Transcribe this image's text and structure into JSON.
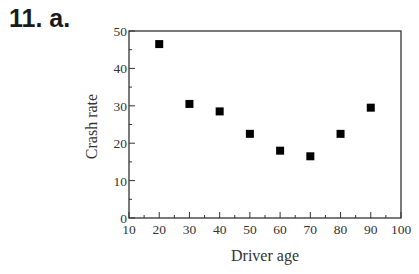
{
  "problem_label": "11.  a.",
  "chart_data": {
    "type": "scatter",
    "title": "",
    "xlabel": "Driver age",
    "ylabel": "Crash rate",
    "xlim": [
      10,
      100
    ],
    "ylim": [
      0,
      50
    ],
    "x_ticks": [
      10,
      20,
      30,
      40,
      50,
      60,
      70,
      80,
      90,
      100
    ],
    "y_ticks": [
      0,
      10,
      20,
      30,
      40,
      50
    ],
    "grid": false,
    "legend": null,
    "marker": "square",
    "x": [
      20,
      30,
      40,
      50,
      60,
      70,
      80,
      90
    ],
    "y": [
      46.5,
      30.5,
      28.5,
      22.5,
      18,
      16.5,
      22.5,
      29.5
    ]
  }
}
